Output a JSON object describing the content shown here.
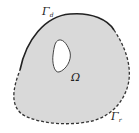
{
  "diagram": {
    "domain_label": "Ω",
    "boundaries": [
      {
        "symbol": "Γ",
        "subscript": "d",
        "style": "solid",
        "position": "top"
      },
      {
        "symbol": "Γ",
        "subscript": "r",
        "style": "dashed",
        "position": "bottom-right"
      }
    ],
    "colors": {
      "fill": "#d9d9d9",
      "stroke": "#333333",
      "hole_fill": "#ffffff"
    }
  }
}
